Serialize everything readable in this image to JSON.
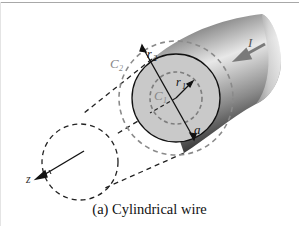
{
  "figure": {
    "caption": "(a)  Cylindrical wire",
    "labels": {
      "current": "I",
      "outer_radius": "r",
      "outer_radius_sub": "2",
      "inner_radius": "r",
      "inner_radius_sub": "1",
      "outer_contour": "C",
      "outer_contour_sub": "2",
      "inner_contour": "C",
      "inner_contour_sub": "1",
      "wire_radius": "a",
      "axis": "z"
    }
  },
  "colors": {
    "wire_face": "#c9c9c9",
    "contour_dashed": "#8a8a8a",
    "axis_dashed": "#222222",
    "arrow": "#7a7a7a"
  }
}
